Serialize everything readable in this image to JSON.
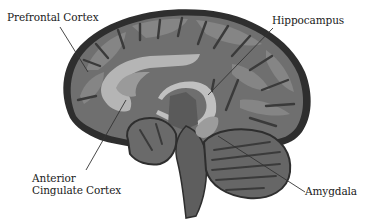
{
  "diagram": {
    "labels": {
      "prefrontal_cortex": "Prefrontal Cortex",
      "hippocampus": "Hippocampus",
      "anterior_cingulate_cortex": [
        "Anterior",
        "Cingulate Cortex"
      ],
      "amygdala": "Amygdala"
    },
    "colors": {
      "outline": "#2e2e2e",
      "cortex_fill": "#6f6f6f",
      "gyri_light": "#858585",
      "sulci_dark": "#3a3a3a",
      "highlight_structure": "#b5b5b5",
      "cerebellum": "#666666",
      "brainstem": "#5e5e5e",
      "leader_line": "#333333",
      "background": "#ffffff"
    }
  }
}
